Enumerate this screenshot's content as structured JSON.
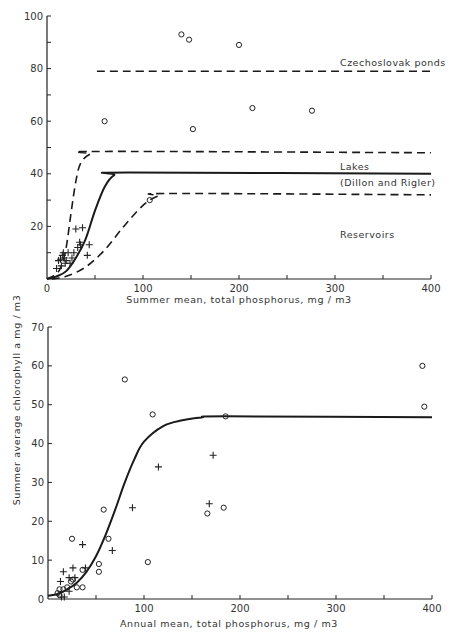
{
  "shared_ylabel": "Summer average chlorophyll a mg / m3",
  "chart_data": [
    {
      "type": "scatter",
      "title": "",
      "xlabel": "Summer mean, total phosphorus, mg / m3",
      "ylabel": "Summer average chlorophyll a mg / m3",
      "xlim": [
        0,
        400
      ],
      "ylim": [
        0,
        100
      ],
      "x_ticks": [
        0,
        100,
        200,
        300,
        400
      ],
      "y_ticks": [
        20,
        40,
        60,
        80,
        100
      ],
      "grid": false,
      "annotations": [
        "Czechoslovak ponds",
        "Lakes",
        "(Dillon and Rigler)",
        "Reservoirs"
      ],
      "series": [
        {
          "name": "circles",
          "marker": "o",
          "points": [
            [
              140,
              93
            ],
            [
              148,
              91
            ],
            [
              200,
              89
            ],
            [
              60,
              60
            ],
            [
              152,
              57
            ],
            [
              214,
              65
            ],
            [
              276,
              64
            ],
            [
              107,
              30
            ]
          ]
        },
        {
          "name": "crosses",
          "marker": "+",
          "points": [
            [
              30,
              19
            ],
            [
              37,
              19.5
            ],
            [
              10,
              4
            ],
            [
              12,
              7
            ],
            [
              14,
              7.5
            ],
            [
              16,
              9
            ],
            [
              17,
              10
            ],
            [
              18,
              8
            ],
            [
              19,
              6
            ],
            [
              20,
              7
            ],
            [
              22,
              10
            ],
            [
              26,
              8
            ],
            [
              28,
              10
            ],
            [
              32,
              12
            ],
            [
              35,
              13
            ],
            [
              42,
              9
            ],
            [
              44,
              13
            ],
            [
              34,
              14
            ],
            [
              15,
              5
            ],
            [
              24,
              6
            ]
          ]
        },
        {
          "name": "Czechoslovak ponds",
          "style": "dashed",
          "points": [
            [
              52,
              79
            ],
            [
              400,
              79
            ]
          ]
        },
        {
          "name": "Upper envelope",
          "style": "dashed",
          "points": [
            [
              0,
              0
            ],
            [
              10,
              2
            ],
            [
              15,
              5
            ],
            [
              20,
              12
            ],
            [
              25,
              25
            ],
            [
              30,
              37
            ],
            [
              35,
              44
            ],
            [
              45,
              47.5
            ],
            [
              60,
              48.5
            ],
            [
              400,
              48
            ]
          ]
        },
        {
          "name": "Lakes (Dillon and Rigler)",
          "style": "solid",
          "points": [
            [
              0,
              0
            ],
            [
              10,
              1
            ],
            [
              20,
              3
            ],
            [
              30,
              8
            ],
            [
              40,
              15
            ],
            [
              50,
              26
            ],
            [
              60,
              35
            ],
            [
              70,
              39.5
            ],
            [
              85,
              40.5
            ],
            [
              400,
              40
            ]
          ]
        },
        {
          "name": "Reservoirs",
          "style": "dashed",
          "points": [
            [
              5,
              0
            ],
            [
              20,
              1
            ],
            [
              40,
              4.5
            ],
            [
              60,
              11
            ],
            [
              80,
              20
            ],
            [
              100,
              28
            ],
            [
              115,
              31.5
            ],
            [
              130,
              32.5
            ],
            [
              400,
              32
            ]
          ]
        }
      ]
    },
    {
      "type": "scatter",
      "title": "",
      "xlabel": "Annual mean, total phosphorus, mg / m3",
      "ylabel": "Summer average chlorophyll a mg / m3",
      "xlim": [
        0,
        400
      ],
      "ylim": [
        0,
        70
      ],
      "x_ticks": [
        100,
        200,
        300,
        400
      ],
      "y_ticks": [
        0,
        10,
        20,
        30,
        40,
        50,
        60,
        70
      ],
      "grid": false,
      "series": [
        {
          "name": "circles",
          "marker": "o",
          "points": [
            [
              80,
              56.5
            ],
            [
              109,
              47.5
            ],
            [
              185,
              47
            ],
            [
              390,
              60
            ],
            [
              392,
              49.5
            ],
            [
              58,
              23
            ],
            [
              63,
              15.5
            ],
            [
              25,
              15.5
            ],
            [
              104,
              9.5
            ],
            [
              53,
              9
            ],
            [
              53,
              7
            ],
            [
              166,
              22
            ],
            [
              183,
              23.5
            ],
            [
              36,
              7.5
            ],
            [
              36,
              3
            ],
            [
              30,
              3
            ],
            [
              26,
              5
            ],
            [
              24,
              4.5
            ],
            [
              20,
              3
            ],
            [
              16,
              2.5
            ],
            [
              12,
              2.5
            ],
            [
              10,
              1.5
            ],
            [
              12,
              1
            ]
          ]
        },
        {
          "name": "crosses",
          "marker": "+",
          "points": [
            [
              172,
              37
            ],
            [
              115,
              34
            ],
            [
              168,
              24.5
            ],
            [
              88,
              23.5
            ],
            [
              67,
              12.5
            ],
            [
              36,
              14
            ],
            [
              26,
              8
            ],
            [
              39,
              8
            ],
            [
              16,
              7
            ],
            [
              22,
              5.5
            ],
            [
              13,
              4.5
            ],
            [
              28,
              5.5
            ],
            [
              22,
              2
            ],
            [
              17,
              0.5
            ],
            [
              14,
              0.5
            ]
          ]
        },
        {
          "name": "Fitted curve",
          "style": "solid",
          "points": [
            [
              0,
              0.8
            ],
            [
              10,
              1.3
            ],
            [
              20,
              2.5
            ],
            [
              30,
              4.2
            ],
            [
              40,
              7
            ],
            [
              50,
              11
            ],
            [
              60,
              16.5
            ],
            [
              70,
              23
            ],
            [
              80,
              30
            ],
            [
              90,
              36
            ],
            [
              100,
              40.5
            ],
            [
              120,
              44.5
            ],
            [
              140,
              46
            ],
            [
              160,
              46.7
            ],
            [
              185,
              47
            ],
            [
              400,
              46.8
            ]
          ]
        }
      ]
    }
  ]
}
